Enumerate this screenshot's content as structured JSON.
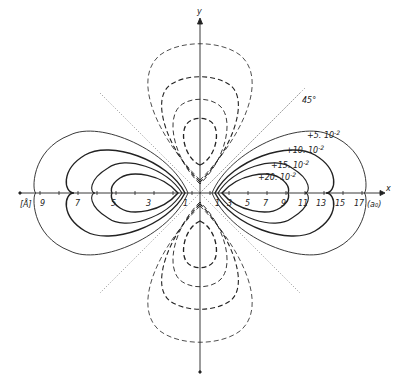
{
  "figure": {
    "type": "contour-diagram",
    "axes": {
      "x_label": "x",
      "y_label": "y",
      "left_unit": "[Å]",
      "right_unit": "(a₀)",
      "left_ticks": [
        "9",
        "7",
        "5",
        "3",
        "1"
      ],
      "right_ticks": [
        "1",
        "3",
        "5",
        "7",
        "9",
        "11",
        "13",
        "15",
        "17"
      ]
    },
    "angle_label": "45°",
    "contour_labels": [
      {
        "text": "+5. 10",
        "exp": "-2"
      },
      {
        "text": "+10. 10",
        "exp": "-2"
      },
      {
        "text": "+15. 10",
        "exp": "-2"
      },
      {
        "text": "+20. 10",
        "exp": "-2"
      }
    ],
    "colors": {
      "line": "#222222",
      "dotted": "#777777",
      "background": "#ffffff"
    }
  }
}
